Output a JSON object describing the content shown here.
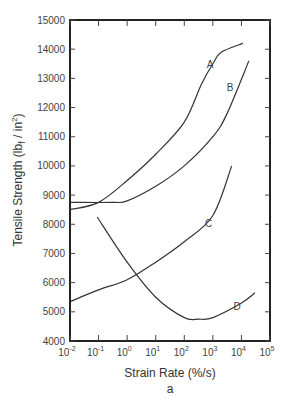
{
  "chart_data": {
    "type": "line",
    "title": "",
    "subtitle": "a",
    "xlabel": "Strain Rate (%/s)",
    "ylabel": "Tensile Strength (lb f / in2)",
    "xscale": "log",
    "xlim": [
      0.01,
      100000
    ],
    "ylim": [
      4000,
      15000
    ],
    "grid": false,
    "legend": "inline curve labels",
    "x_ticks": [
      "10-2",
      "10-1",
      "100",
      "101",
      "102",
      "103",
      "104",
      "105"
    ],
    "y_ticks": [
      4000,
      5000,
      6000,
      7000,
      8000,
      9000,
      10000,
      11000,
      12000,
      13000,
      14000,
      15000
    ],
    "series": [
      {
        "name": "A",
        "log10_x": [
          -2,
          -1,
          0,
          1,
          2,
          2.6,
          3,
          3.3,
          4.05
        ],
        "values": [
          8500,
          8750,
          9500,
          10400,
          11500,
          12800,
          13500,
          13900,
          14200
        ],
        "label_pos": [
          2.9,
          13350
        ]
      },
      {
        "name": "B",
        "log10_x": [
          -2,
          -0.5,
          0,
          1,
          2,
          3,
          3.5,
          4.26
        ],
        "values": [
          8750,
          8750,
          8800,
          9300,
          10000,
          11000,
          11800,
          13600
        ],
        "label_pos": [
          3.6,
          12550
        ]
      },
      {
        "name": "C",
        "log10_x": [
          -2,
          -1,
          0,
          1,
          2,
          3,
          3.66
        ],
        "values": [
          5350,
          5750,
          6100,
          6700,
          7400,
          8300,
          10000
        ],
        "label_pos": [
          2.85,
          7900
        ]
      },
      {
        "name": "D",
        "log10_x": [
          -1.05,
          0,
          1,
          2,
          2.5,
          3,
          4,
          4.47
        ],
        "values": [
          8250,
          6700,
          5500,
          4800,
          4750,
          4800,
          5300,
          5650
        ],
        "label_pos": [
          3.85,
          5050
        ]
      }
    ]
  },
  "labels": {
    "xlabel": "Strain Rate (%/s)",
    "ylabel_main": "Tensile Strength (lb",
    "ylabel_sub": "f",
    "ylabel_tail": " / in",
    "ylabel_sup": "2",
    "ylabel_close": ")",
    "subtitle": "a"
  }
}
